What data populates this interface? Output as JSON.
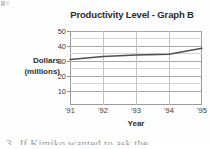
{
  "chart_data": {
    "type": "line",
    "title": "Productivity Level - Graph B",
    "xlabel": "Year",
    "ylabel": "Dollars (millions)",
    "ylabel_lines": [
      "Dollars",
      "(millions)"
    ],
    "categories": [
      "'91",
      "'92",
      "'93",
      "'94",
      "'95"
    ],
    "values": [
      31,
      33,
      34,
      34.5,
      38.5
    ],
    "series": [
      {
        "name": "Productivity Level",
        "values": [
          31,
          33,
          34,
          34.5,
          38.5
        ],
        "color": "#4f4f4f"
      }
    ],
    "ylim": [
      5,
      52
    ],
    "ytick_labels": [
      "50",
      "40",
      "30",
      "20",
      "10"
    ],
    "ytick_values": [
      50,
      40,
      30,
      20,
      10
    ],
    "minor_gridlines": [
      45,
      35,
      25,
      15
    ],
    "grid": true,
    "grid_vertical": true,
    "legend": false,
    "legend_position": "none"
  },
  "page": {
    "question_number": "3.",
    "question_text": "If Kimiko wanted to ask the"
  }
}
